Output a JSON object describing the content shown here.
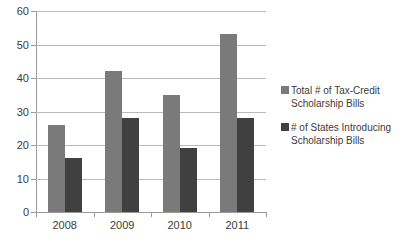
{
  "chart_data": {
    "type": "bar",
    "title": "",
    "subtitle": "",
    "xlabel": "",
    "ylabel": "",
    "categories": [
      "2008",
      "2009",
      "2010",
      "2011"
    ],
    "series": [
      {
        "name": "Total # of Tax-Credit Scholarship Bills",
        "legend_line_1": "Total # of Tax-Credit",
        "legend_line_2": "Scholarship Bills",
        "color": "#7a7a7a",
        "values": [
          26,
          42,
          35,
          53
        ]
      },
      {
        "name": "# of States Introducing Scholarship Bills",
        "legend_line_1": "# of States Introducing",
        "legend_line_2": "Scholarship Bills",
        "color": "#404040",
        "values": [
          16,
          28,
          19,
          28
        ]
      }
    ],
    "ylim": [
      0,
      60
    ],
    "ytick_step": 10,
    "yticks": [
      0,
      10,
      20,
      30,
      40,
      50,
      60
    ],
    "ytick_labels": [
      "0",
      "10",
      "20",
      "30",
      "40",
      "50",
      "60"
    ],
    "grid": true,
    "grid_axis": "y",
    "legend_position": "right",
    "background_color": "#ffffff",
    "gridline_color": "#b9b9b9",
    "axis_color": "#9a9a9a"
  }
}
